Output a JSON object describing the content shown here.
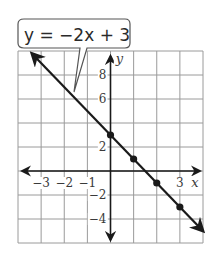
{
  "chart_data": {
    "type": "line",
    "title": "",
    "equation_label": "y = −2x + 3",
    "xlabel": "x",
    "ylabel": "y",
    "xlim": [
      -4,
      4
    ],
    "ylim": [
      -6,
      10
    ],
    "grid": true,
    "grid_step": {
      "x": 1,
      "y": 2
    },
    "x_tick_labels": [
      {
        "value": -3,
        "label": "−3"
      },
      {
        "value": -2,
        "label": "−2"
      },
      {
        "value": -1,
        "label": "−1"
      },
      {
        "value": 3,
        "label": "3"
      }
    ],
    "y_tick_labels": [
      {
        "value": 8,
        "label": "8"
      },
      {
        "value": 6,
        "label": "6"
      },
      {
        "value": 2,
        "label": "2"
      },
      {
        "value": -2,
        "label": "−2"
      },
      {
        "value": -4,
        "label": "−4"
      }
    ],
    "series": [
      {
        "name": "y = −2x + 3",
        "slope": -2,
        "intercept": 3,
        "line_extent": {
          "start": [
            -3.4,
            9.8
          ],
          "end": [
            4,
            -5
          ]
        },
        "points": [
          {
            "x": 0,
            "y": 3
          },
          {
            "x": 1,
            "y": 1
          },
          {
            "x": 2,
            "y": -1
          },
          {
            "x": 3,
            "y": -3
          }
        ]
      }
    ]
  },
  "colors": {
    "grid": "#9a9a9a",
    "axis": "#1a1a1a",
    "line": "#1a1a1a",
    "text": "#2a2a2a"
  }
}
